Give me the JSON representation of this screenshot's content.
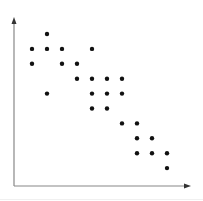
{
  "chart_data": {
    "type": "scatter",
    "title": "",
    "xlabel": "",
    "ylabel": "",
    "grid": false,
    "legend": null,
    "xlim": [
      0,
      11
    ],
    "ylim": [
      0,
      11
    ],
    "points": [
      {
        "x": 2,
        "y": 10
      },
      {
        "x": 1,
        "y": 9
      },
      {
        "x": 2,
        "y": 9
      },
      {
        "x": 3,
        "y": 9
      },
      {
        "x": 5,
        "y": 9
      },
      {
        "x": 1,
        "y": 8
      },
      {
        "x": 3,
        "y": 8
      },
      {
        "x": 4,
        "y": 8
      },
      {
        "x": 4,
        "y": 7
      },
      {
        "x": 5,
        "y": 7
      },
      {
        "x": 6,
        "y": 7
      },
      {
        "x": 7,
        "y": 7
      },
      {
        "x": 2,
        "y": 6
      },
      {
        "x": 5,
        "y": 6
      },
      {
        "x": 6,
        "y": 6
      },
      {
        "x": 7,
        "y": 6
      },
      {
        "x": 5,
        "y": 5
      },
      {
        "x": 6,
        "y": 5
      },
      {
        "x": 7,
        "y": 4
      },
      {
        "x": 8,
        "y": 4
      },
      {
        "x": 8,
        "y": 3
      },
      {
        "x": 9,
        "y": 3
      },
      {
        "x": 8,
        "y": 2
      },
      {
        "x": 9,
        "y": 2
      },
      {
        "x": 10,
        "y": 2
      },
      {
        "x": 10,
        "y": 1
      }
    ]
  },
  "style": {
    "axis_color": "#888888",
    "point_color": "#111111"
  }
}
